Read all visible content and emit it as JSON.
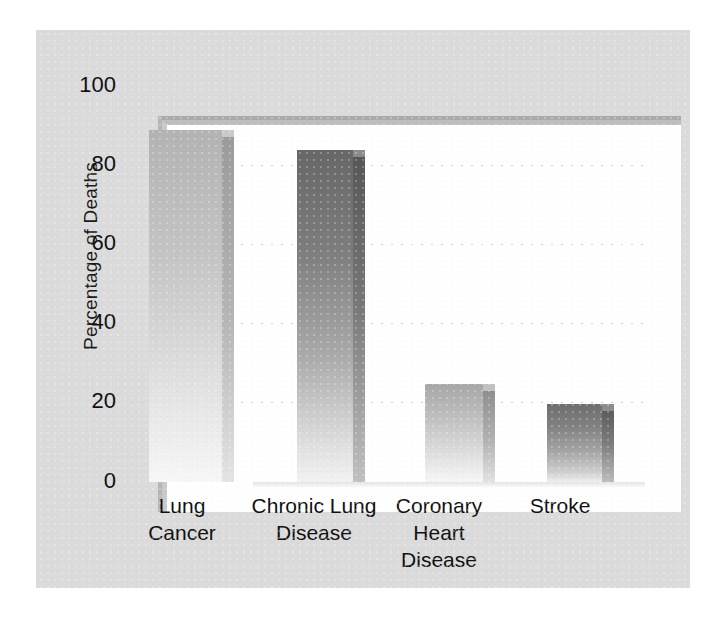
{
  "figure": {
    "panel_color": "#dadbda",
    "plot_background": "#ffffff",
    "text_color": "#111111"
  },
  "axes": {
    "ylabel": "Percentage of Deaths",
    "yticks": [
      "100",
      "80",
      "60",
      "40",
      "20",
      "0"
    ]
  },
  "chart_data": {
    "type": "bar",
    "title": "",
    "xlabel": "",
    "ylabel": "Percentage of Deaths",
    "ylim": [
      0,
      100
    ],
    "yticks": [
      0,
      20,
      40,
      60,
      80,
      100
    ],
    "grid": true,
    "legend": "none",
    "style": "3d-bars-grayscale-gradient",
    "categories": [
      "Lung Cancer",
      "Chronic Lung Disease",
      "Coronary Heart Disease",
      "Stroke"
    ],
    "values": [
      87,
      82,
      23,
      18
    ],
    "bar_colors": [
      "#b2b3b2",
      "#666766",
      "#a6a7a6",
      "#6d6e6d"
    ]
  },
  "categories": [
    {
      "line1": "Lung",
      "line2": "Cancer",
      "line3": ""
    },
    {
      "line1": "Chronic Lung",
      "line2": "Disease",
      "line3": ""
    },
    {
      "line1": "Coronary",
      "line2": "Heart",
      "line3": "Disease"
    },
    {
      "line1": "Stroke",
      "line2": "",
      "line3": ""
    }
  ]
}
